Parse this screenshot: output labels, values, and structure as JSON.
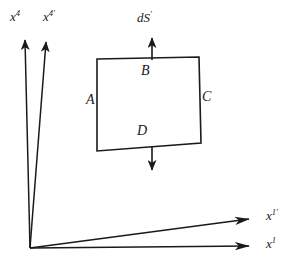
{
  "figure": {
    "name": "surface-element-flux-diagram",
    "background_color": "#ffffff",
    "stroke_color": "#1a1a1a",
    "text_color": "#1a1a1a",
    "width": 297,
    "height": 263
  },
  "axes": {
    "origin": {
      "x": 30,
      "y": 248
    },
    "items": [
      {
        "id": "x4",
        "label_base": "x",
        "label_sup": "4",
        "description": "vertical-time-axis-unprimed",
        "tip": {
          "x": 25,
          "y": 30
        }
      },
      {
        "id": "x4-prime",
        "label_base": "x",
        "label_sup": "4′",
        "description": "vertical-time-axis-primed",
        "tip": {
          "x": 46,
          "y": 32
        }
      },
      {
        "id": "x1-prime",
        "label_base": "x",
        "label_sup": "1′",
        "description": "horizontal-space-axis-primed",
        "tip": {
          "x": 263,
          "y": 218
        }
      },
      {
        "id": "x1",
        "label_base": "x",
        "label_sup": "1",
        "description": "horizontal-space-axis-unprimed",
        "tip": {
          "x": 263,
          "y": 246
        }
      }
    ]
  },
  "surface_element": {
    "label_base": "dS",
    "label_sup": "′",
    "normal_arrow_up": {
      "from": {
        "x": 152,
        "y": 59
      },
      "to": {
        "x": 152,
        "y": 30
      }
    },
    "normal_arrow_down": {
      "from": {
        "x": 152,
        "y": 146
      },
      "to": {
        "x": 152,
        "y": 179
      }
    },
    "corners": {
      "top_left": {
        "x": 97,
        "y": 59
      },
      "top_right": {
        "x": 199,
        "y": 57
      },
      "bottom_right": {
        "x": 201,
        "y": 143
      },
      "bottom_left": {
        "x": 97,
        "y": 151
      }
    },
    "vertices": [
      {
        "id": "A",
        "label": "A",
        "side": "left"
      },
      {
        "id": "B",
        "label": "B",
        "side": "top"
      },
      {
        "id": "C",
        "label": "C",
        "side": "right"
      },
      {
        "id": "D",
        "label": "D",
        "side": "bottom"
      }
    ]
  }
}
